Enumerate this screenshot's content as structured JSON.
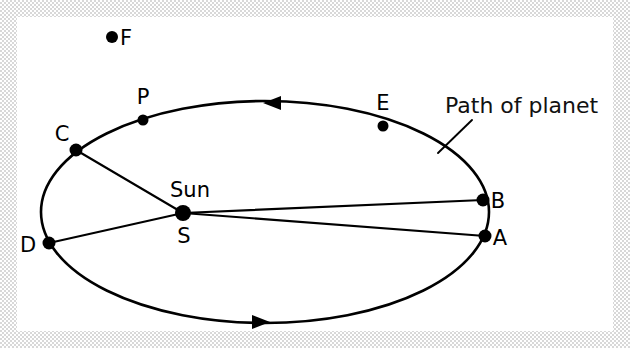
{
  "figure": {
    "background_color": "#ffffff",
    "border_color": "#d8d8d8",
    "ink_color": "#000000"
  },
  "orbit": {
    "shape": "ellipse",
    "center_x": 265,
    "center_y": 212,
    "radius_x": 224,
    "radius_y": 111,
    "stroke_width": 2.6,
    "direction": "counterclockwise"
  },
  "sun": {
    "label": "Sun",
    "point_label": "S",
    "x": 183,
    "y": 213,
    "dot_radius": 8
  },
  "points": [
    {
      "id": "F",
      "label": "F",
      "x": 112,
      "y": 37,
      "label_x": 126,
      "label_y": 45,
      "dot_radius": 6,
      "on_orbit": false
    },
    {
      "id": "P",
      "label": "P",
      "x": 143,
      "y": 120,
      "label_x": 143,
      "label_y": 104,
      "dot_radius": 5.5,
      "on_orbit": true
    },
    {
      "id": "C",
      "label": "C",
      "x": 76,
      "y": 150,
      "label_x": 62,
      "label_y": 141,
      "dot_radius": 6.5,
      "on_orbit": true
    },
    {
      "id": "D",
      "label": "D",
      "x": 49,
      "y": 243,
      "label_x": 28,
      "label_y": 252,
      "dot_radius": 6.5,
      "on_orbit": true
    },
    {
      "id": "E",
      "label": "E",
      "x": 383,
      "y": 126,
      "label_x": 383,
      "label_y": 110,
      "dot_radius": 5.5,
      "on_orbit": true
    },
    {
      "id": "B",
      "label": "B",
      "x": 483,
      "y": 200,
      "label_x": 498,
      "label_y": 208,
      "dot_radius": 6.5,
      "on_orbit": true
    },
    {
      "id": "A",
      "label": "A",
      "x": 485,
      "y": 236,
      "label_x": 500,
      "label_y": 245,
      "dot_radius": 6.5,
      "on_orbit": true
    }
  ],
  "radius_lines": [
    {
      "from": "S",
      "to": "C"
    },
    {
      "from": "S",
      "to": "D"
    },
    {
      "from": "S",
      "to": "B"
    },
    {
      "from": "S",
      "to": "A"
    }
  ],
  "arrows": [
    {
      "id": "top-arrow",
      "x": 278,
      "y": 103,
      "direction": "left",
      "meaning": "orbital motion"
    },
    {
      "id": "bottom-arrow",
      "x": 255,
      "y": 322,
      "direction": "right",
      "meaning": "orbital motion"
    }
  ],
  "annotation": {
    "text": "Path of planet",
    "text_x": 445,
    "text_y": 113,
    "leader_from_x": 472,
    "leader_from_y": 120,
    "leader_to_x": 438,
    "leader_to_y": 153
  }
}
